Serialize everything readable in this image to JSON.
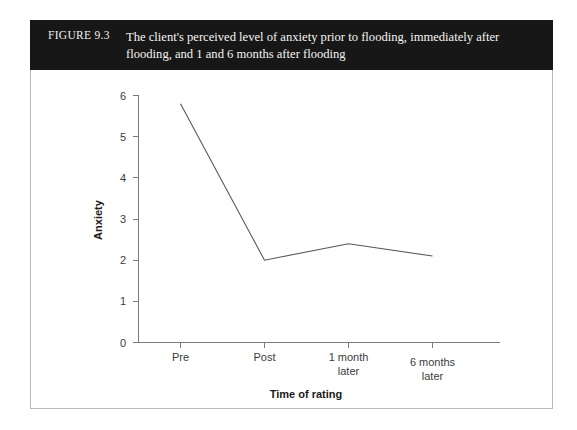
{
  "figure": {
    "number": "FIGURE 9.3",
    "title": "The client's perceived level of anxiety prior to flooding, immediately after flooding, and 1 and 6 months after flooding"
  },
  "chart_data": {
    "type": "line",
    "title": "",
    "categories": [
      "Pre",
      "Post",
      "1 month later",
      "6 months later"
    ],
    "category_lines": [
      [
        "Pre"
      ],
      [
        "Post"
      ],
      [
        "1 month",
        "later"
      ],
      [
        "6 months",
        "later"
      ]
    ],
    "values": [
      5.8,
      2.0,
      2.4,
      2.1
    ],
    "xlabel": "Time of rating",
    "ylabel": "Anxiety",
    "ylim": [
      0,
      6
    ],
    "yticks": [
      0,
      1,
      2,
      3,
      4,
      5,
      6
    ],
    "ytick_labels": [
      "0",
      "1",
      "2",
      "3",
      "4",
      "5",
      "6"
    ],
    "grid": false,
    "legend": false,
    "line_color": "#585858",
    "axis_color": "#7b7b7b"
  },
  "colors": {
    "caption_bar": "#171717",
    "caption_text": "#f5f4f1",
    "frame_border": "#b9b9b9",
    "page_background": "#ffffff"
  }
}
